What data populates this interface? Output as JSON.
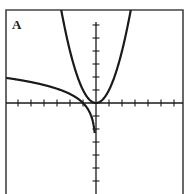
{
  "panel": {
    "label": "A"
  },
  "colors": {
    "frame": "#444444",
    "axis": "#1a1a1a",
    "curve": "#1a1a1a",
    "background": "#ffffff"
  },
  "chart_data": {
    "type": "line",
    "title": "A",
    "xlabel": "",
    "ylabel": "",
    "xlim": [
      -6.9,
      6.7
    ],
    "ylim": [
      -7,
      7.1
    ],
    "grid": false,
    "x_ticks": [
      -6,
      -5,
      -4,
      -3,
      -2,
      -1,
      1,
      2,
      3,
      4,
      5,
      6
    ],
    "y_ticks": [
      -6,
      -5,
      -4,
      -3,
      -2,
      -1,
      1,
      2,
      3,
      4,
      5,
      6
    ],
    "tick_labels_shown": false,
    "legend": null,
    "series": [
      {
        "name": "y = x^2",
        "x": [
          -2.65,
          -2,
          -1.5,
          -1,
          -0.5,
          0,
          0.5,
          1,
          1.5,
          2,
          2.65
        ],
        "y": [
          7.02,
          4,
          2.25,
          1,
          0.25,
          0,
          0.25,
          1,
          2.25,
          4,
          7.02
        ]
      },
      {
        "name": "y = ln(-x)",
        "x": [
          -6.9,
          -6,
          -5,
          -4,
          -3,
          -2,
          -1.5,
          -1,
          -0.7,
          -0.5,
          -0.3,
          -0.2,
          -0.1
        ],
        "y": [
          1.93,
          1.79,
          1.61,
          1.39,
          1.1,
          0.69,
          0.41,
          0,
          -0.36,
          -0.69,
          -1.2,
          -1.61,
          -2.3
        ]
      }
    ]
  }
}
